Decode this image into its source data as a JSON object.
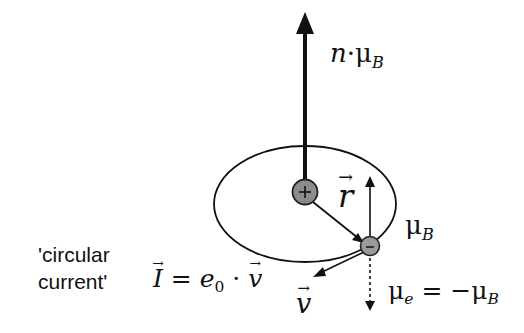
{
  "diagram": {
    "labels": {
      "total_moment": {
        "prefix": "n",
        "dot": "·",
        "mu": "μ",
        "sub": "B"
      },
      "radius_vector": "r",
      "orbit_moment": {
        "mu": "μ",
        "sub": "B"
      },
      "circular_current_line1": "'circular",
      "circular_current_line2": "current'",
      "current_formula": {
        "I": "I",
        "eq": " = ",
        "e": "e",
        "e_sub": "0",
        "dot": " · ",
        "v": "v"
      },
      "velocity": "v",
      "electron_moment": {
        "mu": "μ",
        "sub_e": "e",
        "eq": " = −",
        "mu2": "μ",
        "sub_B": "B"
      }
    },
    "nucleus": {
      "symbol": "+",
      "fill": "#8c8c8c"
    },
    "electron": {
      "symbol": "–",
      "fill": "#9a9a9a"
    },
    "colors": {
      "stroke": "#111111",
      "background": "#ffffff"
    }
  }
}
